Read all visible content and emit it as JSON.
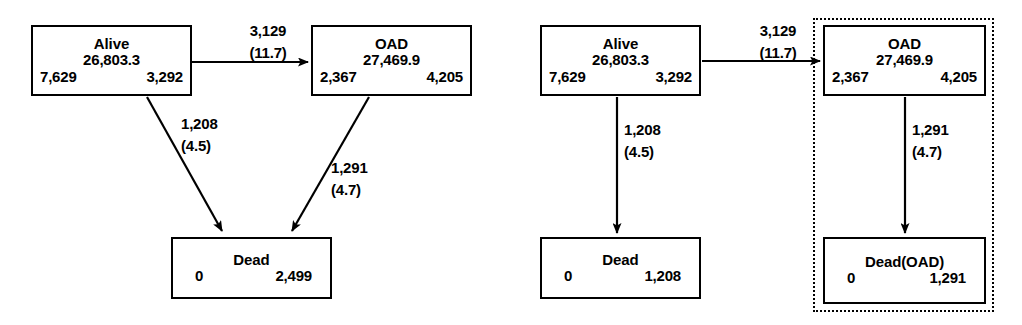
{
  "diagram": {
    "type": "state-transition-diagram",
    "panels": [
      {
        "id": "panel-left",
        "name": "combined-dead-state-model",
        "nodes": [
          {
            "id": "alive",
            "title": "Alive",
            "total": "26,803.3",
            "left_count": "7,629",
            "right_count": "3,292"
          },
          {
            "id": "oad",
            "title": "OAD",
            "total": "27,469.9",
            "left_count": "2,367",
            "right_count": "4,205"
          },
          {
            "id": "dead",
            "title": "Dead",
            "left_count": "0",
            "right_count": "2,499"
          }
        ],
        "edges": [
          {
            "id": "alive-to-oad",
            "from": "alive",
            "to": "oad",
            "count": "3,129",
            "rate": "(11.7)"
          },
          {
            "id": "alive-to-dead",
            "from": "alive",
            "to": "dead",
            "count": "1,208",
            "rate": "(4.5)"
          },
          {
            "id": "oad-to-dead",
            "from": "oad",
            "to": "dead",
            "count": "1,291",
            "rate": "(4.7)"
          }
        ]
      },
      {
        "id": "panel-right",
        "name": "separated-dead-state-model",
        "nodes": [
          {
            "id": "alive",
            "title": "Alive",
            "total": "26,803.3",
            "left_count": "7,629",
            "right_count": "3,292"
          },
          {
            "id": "oad",
            "title": "OAD",
            "total": "27,469.9",
            "left_count": "2,367",
            "right_count": "4,205"
          },
          {
            "id": "dead",
            "title": "Dead",
            "left_count": "0",
            "right_count": "1,208"
          },
          {
            "id": "dead_oad",
            "title": "Dead(OAD)",
            "left_count": "0",
            "right_count": "1,291"
          }
        ],
        "edges": [
          {
            "id": "alive-to-oad",
            "from": "alive",
            "to": "oad",
            "count": "3,129",
            "rate": "(11.7)"
          },
          {
            "id": "alive-to-dead",
            "from": "alive",
            "to": "dead",
            "count": "1,208",
            "rate": "(4.5)"
          },
          {
            "id": "oad-to-dead-oad",
            "from": "oad",
            "to": "dead_oad",
            "count": "1,291",
            "rate": "(4.7)"
          }
        ],
        "grouping": {
          "id": "oad-subsystem-group",
          "style": "dotted-border",
          "members": [
            "oad",
            "dead_oad"
          ]
        }
      }
    ],
    "colors": {
      "stroke": "#000000",
      "background": "#ffffff"
    }
  }
}
